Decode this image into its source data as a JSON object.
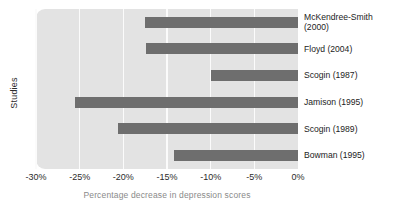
{
  "chart_data": {
    "type": "bar",
    "orientation": "horizontal",
    "title": "",
    "xlabel": "Percentage decrease in depression scores",
    "ylabel": "Studies",
    "categories": [
      "McKendree-Smith\n(2000)",
      "Floyd (2004)",
      "Scogin (1987)",
      "Jamison (1995)",
      "Scogin (1989)",
      "Bowman (1995)"
    ],
    "values": [
      -17.5,
      -17.4,
      -10.0,
      -25.5,
      -20.6,
      -14.2
    ],
    "xlim": [
      -30,
      0
    ],
    "xticks": [
      -30,
      -25,
      -20,
      -15,
      -10,
      -5,
      0
    ],
    "xtick_labels": [
      "-30%",
      "-25%",
      "-20%",
      "-15%",
      "-10%",
      "-5%",
      "0%"
    ],
    "grid": true,
    "grid_axis": "x",
    "legend": false,
    "colors": {
      "bar": "#6e6e6e",
      "plot_background": "#e3e3e3",
      "gridline": "#fbfbfb",
      "page_background": "#ffffff",
      "tick_label": "#2b2b2b",
      "axis_title_x": "#8a8a8a",
      "axis_title_y": "#2b2b2b",
      "category_label": "#1c1c1c"
    }
  }
}
